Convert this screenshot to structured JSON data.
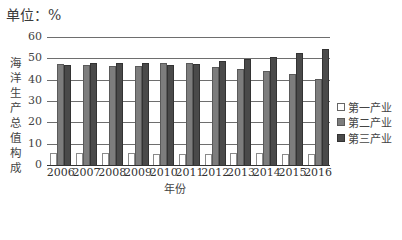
{
  "header": {
    "unit_label": "单位：%"
  },
  "chart_data": {
    "type": "bar",
    "title": "",
    "unit": "%",
    "xlabel": "年份",
    "ylabel": "海洋生产总值构成",
    "ylim": [
      0,
      60
    ],
    "yticks": [
      0,
      10,
      20,
      30,
      40,
      50,
      60
    ],
    "grid": true,
    "legend_position": "right",
    "categories": [
      "2006",
      "2007",
      "2008",
      "2009",
      "2010",
      "2011",
      "2012",
      "2013",
      "2014",
      "2015",
      "2016"
    ],
    "series": [
      {
        "name": "第一产业",
        "color": "#ffffff",
        "values": [
          5.7,
          5.4,
          5.7,
          5.8,
          5.1,
          5.1,
          5.3,
          5.4,
          5.4,
          5.1,
          5.1
        ]
      },
      {
        "name": "第二产业",
        "color": "#7d7d7d",
        "values": [
          47.3,
          46.9,
          46.4,
          46.2,
          47.8,
          47.7,
          46.1,
          45.1,
          43.9,
          42.5,
          40.4
        ]
      },
      {
        "name": "第三产业",
        "color": "#4a4a4a",
        "values": [
          47.0,
          47.7,
          47.9,
          48.0,
          47.1,
          47.2,
          48.6,
          49.5,
          50.7,
          52.4,
          54.5
        ]
      }
    ]
  }
}
